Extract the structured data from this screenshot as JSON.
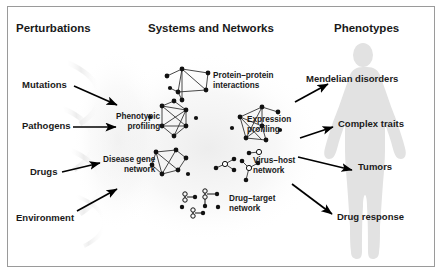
{
  "figure": {
    "background_color": "#ffffff",
    "border_color": "#9a9a9a",
    "silhouette_color": "#e2e2e2",
    "node_color": "#111111",
    "edge_color": "#333333",
    "arrow_color": "#000000"
  },
  "columns": {
    "left_header": "Perturbations",
    "center_header": "Systems and Networks",
    "right_header": "Phenotypes"
  },
  "perturbations": [
    {
      "label": "Mutations"
    },
    {
      "label": "Pathogens"
    },
    {
      "label": "Drugs"
    },
    {
      "label": "Environment"
    }
  ],
  "networks": [
    {
      "label_line1": "Protein–protein",
      "label_line2": "interactions",
      "node_count": 7,
      "node_style": "filled"
    },
    {
      "label_line1": "Phenotypic",
      "label_line2": "profiling",
      "node_count": 8,
      "node_style": "filled"
    },
    {
      "label_line1": "Expression",
      "label_line2": "profiling",
      "node_count": 8,
      "node_style": "filled"
    },
    {
      "label_line1": "Disease gene",
      "label_line2": "network",
      "node_count": 7,
      "node_style": "filled"
    },
    {
      "label_line1": "Virus–host",
      "label_line2": "network",
      "node_count": 9,
      "node_style": "mixed-open-filled"
    },
    {
      "label_line1": "Drug–target",
      "label_line2": "network",
      "node_count": 8,
      "node_style": "drug-glyph"
    }
  ],
  "phenotypes": [
    {
      "label": "Mendelian disorders"
    },
    {
      "label": "Complex traits"
    },
    {
      "label": "Tumors"
    },
    {
      "label": "Drug response"
    }
  ]
}
